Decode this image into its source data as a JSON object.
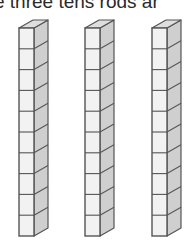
{
  "caption": "e three tens rods ar",
  "rods": [
    {
      "name": "tens-rod-1",
      "x": 19,
      "cubes": 10
    },
    {
      "name": "tens-rod-2",
      "x": 85,
      "cubes": 10
    },
    {
      "name": "tens-rod-3",
      "x": 152,
      "cubes": 10
    }
  ],
  "colors": {
    "front": "#f2f2f2",
    "side": "#cfcfcf",
    "top": "#dedede",
    "edge": "#555555"
  }
}
